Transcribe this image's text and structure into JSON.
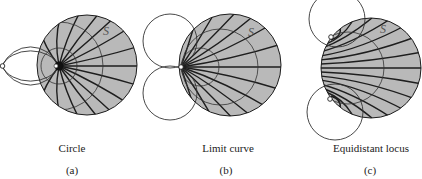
{
  "figure": {
    "panels": [
      {
        "id": "a",
        "title": "Circle",
        "sublabel": "(a)",
        "set_label": "S"
      },
      {
        "id": "b",
        "title": "Limit curve",
        "sublabel": "(b)",
        "set_label": "S"
      },
      {
        "id": "c",
        "title": "Equidistant locus",
        "sublabel": "(c)",
        "set_label": "S"
      }
    ],
    "colors": {
      "disk_fill": "#b9b9b9",
      "line": "#1e1e1e",
      "thin_line": "#333333",
      "background": "#ffffff"
    }
  }
}
